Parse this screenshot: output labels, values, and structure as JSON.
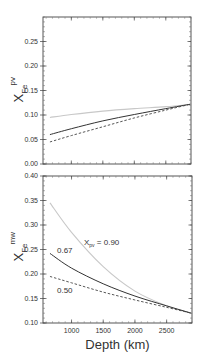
{
  "chart_data": [
    {
      "type": "line",
      "panel": "top",
      "title": "",
      "xlabel": "",
      "ylabel": "X_Fe^pv",
      "ylabel_main": "X",
      "ylabel_sub": "Fe",
      "ylabel_sup": "pv",
      "xlim": [
        550,
        2900
      ],
      "ylim": [
        0.0,
        0.3
      ],
      "yticks": [
        0.0,
        0.05,
        0.1,
        0.15,
        0.2,
        0.25
      ],
      "ytick_labels": [
        "0.00",
        "0.05",
        "0.10",
        "0.15",
        "0.20",
        "0.25"
      ],
      "series": [
        {
          "name": "X_pv = 0.90",
          "style": "light-gray-solid",
          "x": [
            660,
            1000,
            1500,
            2000,
            2500,
            2890
          ],
          "y": [
            0.095,
            0.101,
            0.108,
            0.113,
            0.117,
            0.122
          ]
        },
        {
          "name": "X_pv = 0.67",
          "style": "black-solid",
          "x": [
            660,
            1000,
            1500,
            2000,
            2500,
            2890
          ],
          "y": [
            0.06,
            0.072,
            0.088,
            0.101,
            0.113,
            0.122
          ]
        },
        {
          "name": "X_pv = 0.50",
          "style": "black-dashed",
          "x": [
            660,
            1000,
            1500,
            2000,
            2500,
            2890
          ],
          "y": [
            0.045,
            0.058,
            0.076,
            0.094,
            0.11,
            0.122
          ]
        }
      ]
    },
    {
      "type": "line",
      "panel": "bottom",
      "title": "",
      "xlabel": "Depth (km)",
      "ylabel": "X_Fe^mw",
      "ylabel_main": "X",
      "ylabel_sub": "Fe",
      "ylabel_sup": "mw",
      "xlim": [
        550,
        2900
      ],
      "ylim": [
        0.1,
        0.4
      ],
      "xticks": [
        1000,
        1500,
        2000,
        2500
      ],
      "xtick_labels": [
        "1000",
        "1500",
        "2000",
        "2500"
      ],
      "yticks": [
        0.1,
        0.15,
        0.2,
        0.25,
        0.3,
        0.35,
        0.4
      ],
      "ytick_labels": [
        "0.10",
        "0.15",
        "0.20",
        "0.25",
        "0.30",
        "0.35",
        "0.40"
      ],
      "annotations": [
        {
          "text_main": "X",
          "text_sub": "pv",
          "text_rest": " = 0.90"
        },
        {
          "text": "0.67"
        },
        {
          "text": "0.50"
        }
      ],
      "series": [
        {
          "name": "X_pv = 0.90",
          "style": "light-gray-solid",
          "x": [
            660,
            1000,
            1500,
            2000,
            2500,
            2890
          ],
          "y": [
            0.345,
            0.285,
            0.215,
            0.165,
            0.135,
            0.12
          ]
        },
        {
          "name": "X_pv = 0.67",
          "style": "black-solid",
          "x": [
            660,
            1000,
            1500,
            2000,
            2500,
            2890
          ],
          "y": [
            0.242,
            0.212,
            0.18,
            0.155,
            0.135,
            0.12
          ]
        },
        {
          "name": "X_pv = 0.50",
          "style": "black-dashed",
          "x": [
            660,
            1000,
            1500,
            2000,
            2500,
            2890
          ],
          "y": [
            0.195,
            0.182,
            0.163,
            0.147,
            0.132,
            0.12
          ]
        }
      ]
    }
  ]
}
